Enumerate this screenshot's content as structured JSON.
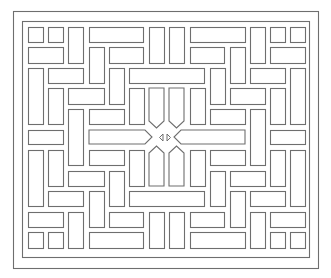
{
  "artwork": {
    "title": "Geometric lattice pattern",
    "stroke_color": "#6e6e6e",
    "background_color": "#ffffff",
    "outer_frame": {
      "x": 13,
      "y": 11,
      "w": 305,
      "h": 257
    },
    "inner_frame": {
      "x": 22,
      "y": 21,
      "w": 287,
      "h": 236
    },
    "rects": [
      {
        "x": 28,
        "y": 27,
        "w": 15,
        "h": 15
      },
      {
        "x": 48,
        "y": 27,
        "w": 15,
        "h": 15
      },
      {
        "x": 68,
        "y": 27,
        "w": 15,
        "h": 36
      },
      {
        "x": 89,
        "y": 27,
        "w": 54,
        "h": 15
      },
      {
        "x": 149,
        "y": 27,
        "w": 15,
        "h": 36
      },
      {
        "x": 169,
        "y": 27,
        "w": 15,
        "h": 36
      },
      {
        "x": 190,
        "y": 27,
        "w": 55,
        "h": 15
      },
      {
        "x": 250,
        "y": 27,
        "w": 15,
        "h": 36
      },
      {
        "x": 270,
        "y": 27,
        "w": 15,
        "h": 15
      },
      {
        "x": 290,
        "y": 27,
        "w": 15,
        "h": 15
      },
      {
        "x": 28,
        "y": 47,
        "w": 35,
        "h": 16
      },
      {
        "x": 89,
        "y": 47,
        "w": 15,
        "h": 36
      },
      {
        "x": 109,
        "y": 47,
        "w": 34,
        "h": 16
      },
      {
        "x": 190,
        "y": 47,
        "w": 34,
        "h": 16
      },
      {
        "x": 230,
        "y": 47,
        "w": 15,
        "h": 36
      },
      {
        "x": 270,
        "y": 47,
        "w": 35,
        "h": 16
      },
      {
        "x": 28,
        "y": 68,
        "w": 15,
        "h": 56
      },
      {
        "x": 48,
        "y": 68,
        "w": 35,
        "h": 15
      },
      {
        "x": 109,
        "y": 68,
        "w": 15,
        "h": 36
      },
      {
        "x": 129,
        "y": 68,
        "w": 75,
        "h": 15
      },
      {
        "x": 210,
        "y": 68,
        "w": 15,
        "h": 36
      },
      {
        "x": 250,
        "y": 68,
        "w": 35,
        "h": 15
      },
      {
        "x": 290,
        "y": 68,
        "w": 15,
        "h": 56
      },
      {
        "x": 48,
        "y": 88,
        "w": 15,
        "h": 36
      },
      {
        "x": 68,
        "y": 88,
        "w": 36,
        "h": 16
      },
      {
        "x": 129,
        "y": 88,
        "w": 15,
        "h": 36
      },
      {
        "x": 190,
        "y": 88,
        "w": 15,
        "h": 36
      },
      {
        "x": 230,
        "y": 88,
        "w": 35,
        "h": 16
      },
      {
        "x": 270,
        "y": 88,
        "w": 15,
        "h": 36
      },
      {
        "x": 68,
        "y": 109,
        "w": 15,
        "h": 56
      },
      {
        "x": 89,
        "y": 109,
        "w": 35,
        "h": 15
      },
      {
        "x": 210,
        "y": 109,
        "w": 35,
        "h": 15
      },
      {
        "x": 250,
        "y": 109,
        "w": 15,
        "h": 56
      },
      {
        "x": 28,
        "y": 130,
        "w": 35,
        "h": 14
      },
      {
        "x": 270,
        "y": 130,
        "w": 35,
        "h": 14
      },
      {
        "x": 28,
        "y": 150,
        "w": 15,
        "h": 56
      },
      {
        "x": 48,
        "y": 150,
        "w": 15,
        "h": 36
      },
      {
        "x": 89,
        "y": 150,
        "w": 35,
        "h": 15
      },
      {
        "x": 129,
        "y": 150,
        "w": 15,
        "h": 36
      },
      {
        "x": 190,
        "y": 150,
        "w": 15,
        "h": 36
      },
      {
        "x": 210,
        "y": 150,
        "w": 35,
        "h": 15
      },
      {
        "x": 270,
        "y": 150,
        "w": 15,
        "h": 36
      },
      {
        "x": 290,
        "y": 150,
        "w": 15,
        "h": 56
      },
      {
        "x": 68,
        "y": 171,
        "w": 36,
        "h": 15
      },
      {
        "x": 109,
        "y": 171,
        "w": 15,
        "h": 35
      },
      {
        "x": 210,
        "y": 171,
        "w": 15,
        "h": 35
      },
      {
        "x": 230,
        "y": 171,
        "w": 35,
        "h": 15
      },
      {
        "x": 48,
        "y": 191,
        "w": 35,
        "h": 15
      },
      {
        "x": 89,
        "y": 191,
        "w": 15,
        "h": 36
      },
      {
        "x": 129,
        "y": 191,
        "w": 75,
        "h": 15
      },
      {
        "x": 230,
        "y": 191,
        "w": 15,
        "h": 36
      },
      {
        "x": 250,
        "y": 191,
        "w": 35,
        "h": 15
      },
      {
        "x": 28,
        "y": 212,
        "w": 35,
        "h": 15
      },
      {
        "x": 68,
        "y": 212,
        "w": 15,
        "h": 36
      },
      {
        "x": 109,
        "y": 212,
        "w": 34,
        "h": 15
      },
      {
        "x": 149,
        "y": 212,
        "w": 15,
        "h": 36
      },
      {
        "x": 169,
        "y": 212,
        "w": 15,
        "h": 36
      },
      {
        "x": 190,
        "y": 212,
        "w": 34,
        "h": 15
      },
      {
        "x": 250,
        "y": 212,
        "w": 15,
        "h": 36
      },
      {
        "x": 270,
        "y": 212,
        "w": 35,
        "h": 15
      },
      {
        "x": 28,
        "y": 232,
        "w": 15,
        "h": 16
      },
      {
        "x": 48,
        "y": 232,
        "w": 15,
        "h": 16
      },
      {
        "x": 89,
        "y": 232,
        "w": 54,
        "h": 16
      },
      {
        "x": 190,
        "y": 232,
        "w": 55,
        "h": 16
      },
      {
        "x": 270,
        "y": 232,
        "w": 15,
        "h": 16
      },
      {
        "x": 290,
        "y": 232,
        "w": 15,
        "h": 16
      }
    ],
    "center_shapes": {
      "pointed_down_left": "149,88 164,88 164,121 156.5,128 149,121",
      "pointed_down_right": "169,88 184,88 184,121 176.5,128 169,121",
      "pointed_up_left": "149,186 164,186 164,153 156.5,146 149,153",
      "pointed_up_right": "169,186 184,186 184,153 176.5,146 169,153",
      "pointed_right_bar": "89,130 145,130 152,137 145,144 89,144",
      "pointed_left_bar": "245,130 181,130 174,137 181,144 245,144",
      "triangle_left": "163,134 163,141 159.5,137.5",
      "triangle_right": "167,134 167,141 170.5,137.5"
    }
  }
}
